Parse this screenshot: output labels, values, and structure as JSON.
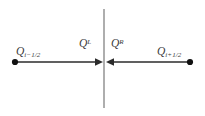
{
  "figure": {
    "width": 205,
    "height": 116,
    "background_color": "#ffffff"
  },
  "colors": {
    "axis_line": "#2b2b2b",
    "interface_line": "#8c8c8c",
    "dot": "#111111",
    "text": "#3b3b3b"
  },
  "geometry": {
    "axis_y": 62,
    "interface_x": 104,
    "interface_top_y": 9,
    "interface_bottom_y": 108,
    "left_dot_x": 15,
    "right_dot_x": 190
  },
  "labels": {
    "left_state": {
      "base": "Q",
      "sub": "i−1/2"
    },
    "left_flux": {
      "base": "Q",
      "sup": "L"
    },
    "right_flux": {
      "base": "Q",
      "sup": "R"
    },
    "right_state": {
      "base": "Q",
      "sub": "i+1/2"
    }
  },
  "elements": {
    "left_arrow_direction": "right",
    "right_arrow_direction": "left",
    "interface_line_style": "solid-vertical-gray",
    "axis_line_style": "solid-horizontal-dark"
  }
}
